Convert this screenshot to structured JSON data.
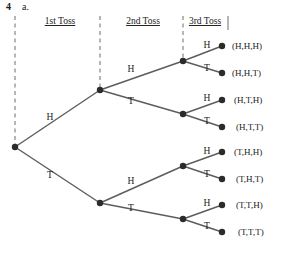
{
  "exercise": {
    "number": "4",
    "part": "a."
  },
  "headers": [
    {
      "label": "1st Toss",
      "x": 60,
      "y": 24
    },
    {
      "label": "2nd Toss",
      "x": 143,
      "y": 24
    },
    {
      "label": "3rd Toss",
      "x": 205,
      "y": 24
    }
  ],
  "dividers": [
    {
      "name": "divider-left",
      "x": 15,
      "y1": 16,
      "y2": 147
    },
    {
      "name": "divider-mid",
      "x": 100,
      "y1": 16,
      "y2": 90
    },
    {
      "name": "divider-third",
      "x": 183,
      "y1": 16,
      "y2": 61
    },
    {
      "name": "divider-right",
      "x": 228,
      "y1": 16,
      "y2": 30
    }
  ],
  "nodes": [
    {
      "name": "root-node",
      "x": 15,
      "y": 147
    },
    {
      "name": "node-h",
      "x": 100,
      "y": 90
    },
    {
      "name": "node-t",
      "x": 100,
      "y": 203
    },
    {
      "name": "node-hh",
      "x": 183,
      "y": 61
    },
    {
      "name": "node-ht",
      "x": 183,
      "y": 114
    },
    {
      "name": "node-th",
      "x": 183,
      "y": 166
    },
    {
      "name": "node-tt",
      "x": 183,
      "y": 219
    },
    {
      "name": "leaf-hhh",
      "x": 222,
      "y": 46
    },
    {
      "name": "leaf-hht",
      "x": 222,
      "y": 73
    },
    {
      "name": "leaf-hth",
      "x": 222,
      "y": 100
    },
    {
      "name": "leaf-htt",
      "x": 222,
      "y": 127
    },
    {
      "name": "leaf-thh",
      "x": 222,
      "y": 152
    },
    {
      "name": "leaf-tht",
      "x": 222,
      "y": 179
    },
    {
      "name": "leaf-tth",
      "x": 222,
      "y": 205
    },
    {
      "name": "leaf-ttt",
      "x": 222,
      "y": 232
    }
  ],
  "edges": [
    {
      "name": "edge-root-h",
      "x1": 15,
      "y1": 147,
      "x2": 100,
      "y2": 90
    },
    {
      "name": "edge-root-t",
      "x1": 15,
      "y1": 147,
      "x2": 100,
      "y2": 203
    },
    {
      "name": "edge-h-hh",
      "x1": 100,
      "y1": 90,
      "x2": 183,
      "y2": 61
    },
    {
      "name": "edge-h-ht",
      "x1": 100,
      "y1": 90,
      "x2": 183,
      "y2": 114
    },
    {
      "name": "edge-t-th",
      "x1": 100,
      "y1": 203,
      "x2": 183,
      "y2": 166
    },
    {
      "name": "edge-t-tt",
      "x1": 100,
      "y1": 203,
      "x2": 183,
      "y2": 219
    },
    {
      "name": "edge-hh-hhh",
      "x1": 183,
      "y1": 61,
      "x2": 222,
      "y2": 46
    },
    {
      "name": "edge-hh-hht",
      "x1": 183,
      "y1": 61,
      "x2": 222,
      "y2": 73
    },
    {
      "name": "edge-ht-hth",
      "x1": 183,
      "y1": 114,
      "x2": 222,
      "y2": 100
    },
    {
      "name": "edge-ht-htt",
      "x1": 183,
      "y1": 114,
      "x2": 222,
      "y2": 127
    },
    {
      "name": "edge-th-thh",
      "x1": 183,
      "y1": 166,
      "x2": 222,
      "y2": 152
    },
    {
      "name": "edge-th-tht",
      "x1": 183,
      "y1": 166,
      "x2": 222,
      "y2": 179
    },
    {
      "name": "edge-tt-tth",
      "x1": 183,
      "y1": 219,
      "x2": 222,
      "y2": 205
    },
    {
      "name": "edge-tt-ttt",
      "x1": 183,
      "y1": 219,
      "x2": 222,
      "y2": 232
    }
  ],
  "branch_labels": [
    {
      "name": "branch-label-root-h",
      "text": "H",
      "x": 50,
      "y": 120
    },
    {
      "name": "branch-label-root-t",
      "text": "T",
      "x": 50,
      "y": 178
    },
    {
      "name": "branch-label-h-hh",
      "text": "H",
      "x": 131,
      "y": 72
    },
    {
      "name": "branch-label-h-ht",
      "text": "T",
      "x": 131,
      "y": 104
    },
    {
      "name": "branch-label-t-th",
      "text": "H",
      "x": 131,
      "y": 184
    },
    {
      "name": "branch-label-t-tt",
      "text": "T",
      "x": 131,
      "y": 211
    },
    {
      "name": "branch-label-hh-hhh",
      "text": "H",
      "x": 207,
      "y": 48
    },
    {
      "name": "branch-label-hh-hht",
      "text": "T",
      "x": 207,
      "y": 71
    },
    {
      "name": "branch-label-ht-hth",
      "text": "H",
      "x": 207,
      "y": 101
    },
    {
      "name": "branch-label-ht-htt",
      "text": "T",
      "x": 207,
      "y": 124
    },
    {
      "name": "branch-label-th-thh",
      "text": "H",
      "x": 207,
      "y": 154
    },
    {
      "name": "branch-label-th-tht",
      "text": "T",
      "x": 207,
      "y": 177
    },
    {
      "name": "branch-label-tt-tth",
      "text": "H",
      "x": 207,
      "y": 206
    },
    {
      "name": "branch-label-tt-ttt",
      "text": "T",
      "x": 207,
      "y": 229
    }
  ],
  "outcomes": [
    {
      "name": "outcome-hhh",
      "text": "(H,H,H)",
      "x": 232,
      "y": 49
    },
    {
      "name": "outcome-hht",
      "text": "(H,H,T)",
      "x": 232,
      "y": 76
    },
    {
      "name": "outcome-hth",
      "text": "(H,T,H)",
      "x": 234,
      "y": 103
    },
    {
      "name": "outcome-htt",
      "text": "(H,T,T)",
      "x": 236,
      "y": 130
    },
    {
      "name": "outcome-thh",
      "text": "(T,H,H)",
      "x": 234,
      "y": 155
    },
    {
      "name": "outcome-tht",
      "text": "(T,H,T)",
      "x": 236,
      "y": 182
    },
    {
      "name": "outcome-tth",
      "text": "(T,T,H)",
      "x": 236,
      "y": 208
    },
    {
      "name": "outcome-ttt",
      "text": "(T,T,T)",
      "x": 238,
      "y": 235
    }
  ],
  "colors": {
    "edge": "#5c5c5c",
    "node": "#2b2b2b",
    "divider": "#6e6e6e",
    "text": "#1a1a1a",
    "background": "#ffffff"
  }
}
